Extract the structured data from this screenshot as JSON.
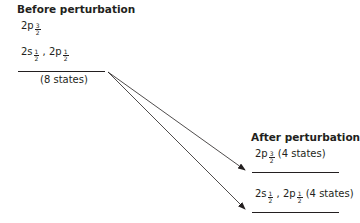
{
  "before": {
    "heading": "Before perturbation",
    "upper_label": {
      "base": "2p",
      "sub_num": "3",
      "sub_den": "2"
    },
    "lower_label": {
      "part1": {
        "base": "2s",
        "sub_num": "1",
        "sub_den": "2"
      },
      "sep": " , ",
      "part2": {
        "base": "2p",
        "sub_num": "1",
        "sub_den": "2"
      }
    },
    "states": "(8 states)"
  },
  "after": {
    "heading": "After perturbation",
    "upper_label": {
      "base": "2p",
      "sub_num": "3",
      "sub_den": "2",
      "states": "(4 states)"
    },
    "lower_label": {
      "part1": {
        "base": "2s",
        "sub_num": "1",
        "sub_den": "2"
      },
      "sep": " , ",
      "part2": {
        "base": "2p",
        "sub_num": "1",
        "sub_den": "2"
      },
      "states": "(4 states)"
    }
  },
  "colors": {
    "ink": "#231f20"
  }
}
